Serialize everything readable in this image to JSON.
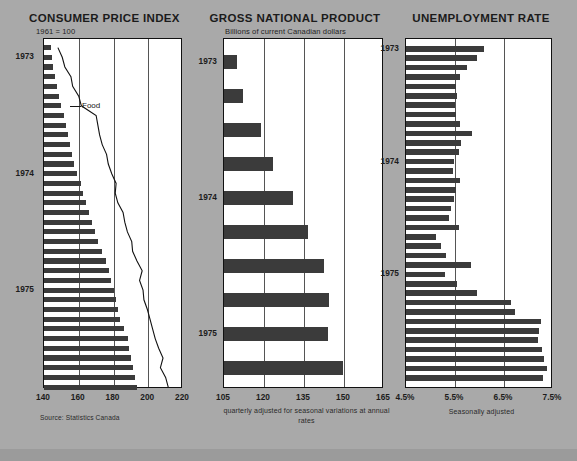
{
  "page": {
    "background_color": "#a9a9a9",
    "source_note": "Source: Statistics Canada"
  },
  "chart_data": [
    {
      "id": "consumer-price-index",
      "type": "bar",
      "orientation": "horizontal",
      "title": "CONSUMER PRICE INDEX",
      "subtitle": "1961 = 100",
      "xlabel": "",
      "ylabel": "",
      "xlim": [
        140,
        220
      ],
      "xticks": [
        "140",
        "160",
        "180",
        "200",
        "220"
      ],
      "xtick_values": [
        140,
        160,
        180,
        200,
        220
      ],
      "grid": true,
      "legend": "Food",
      "footnote": "Source: Statistics Canada",
      "ytick_labels": [
        "1973",
        "1974",
        "1975"
      ],
      "ytick_index": [
        1,
        13,
        25
      ],
      "categories": [
        "1973-01",
        "1973-02",
        "1973-03",
        "1973-04",
        "1973-05",
        "1973-06",
        "1973-07",
        "1973-08",
        "1973-09",
        "1973-10",
        "1973-11",
        "1973-12",
        "1974-01",
        "1974-02",
        "1974-03",
        "1974-04",
        "1974-05",
        "1974-06",
        "1974-07",
        "1974-08",
        "1974-09",
        "1974-10",
        "1974-11",
        "1974-12",
        "1975-01",
        "1975-02",
        "1975-03",
        "1975-04",
        "1975-05",
        "1975-06",
        "1975-07",
        "1975-08",
        "1975-09",
        "1975-10",
        "1975-11",
        "1975-12"
      ],
      "values": [
        143.8,
        144.6,
        145.4,
        146.3,
        147.2,
        148.4,
        149.6,
        151.6,
        152.8,
        153.9,
        154.8,
        155.9,
        157.2,
        159.2,
        161.1,
        162.3,
        164.0,
        165.8,
        167.5,
        169.6,
        171.2,
        173.6,
        175.6,
        177.2,
        178.5,
        180.1,
        181.4,
        182.4,
        184.0,
        185.9,
        188.2,
        189.2,
        190.2,
        191.5,
        192.5,
        193.8
      ],
      "series": [
        {
          "name": "Food",
          "type": "line",
          "values": [
            148.0,
            150.5,
            152.0,
            155.5,
            156.5,
            160.0,
            161.5,
            170.0,
            171.0,
            172.0,
            173.5,
            176.0,
            177.0,
            179.0,
            181.5,
            181.0,
            182.5,
            185.5,
            186.5,
            188.0,
            190.5,
            191.0,
            193.5,
            196.5,
            195.0,
            197.0,
            197.5,
            199.5,
            201.0,
            202.5,
            204.0,
            206.0,
            208.5,
            207.0,
            210.0,
            211.5
          ]
        }
      ]
    },
    {
      "id": "gross-national-product",
      "type": "bar",
      "orientation": "horizontal",
      "title": "GROSS NATIONAL PRODUCT",
      "subtitle": "Billions of current Canadian dollars",
      "xlabel": "",
      "ylabel": "",
      "xlim": [
        105,
        165
      ],
      "xticks": [
        "105",
        "120",
        "135",
        "150",
        "165"
      ],
      "xtick_values": [
        105,
        120,
        135,
        150,
        165
      ],
      "grid": true,
      "footnote": "quarterly adjusted for seasonal variations at annual rates",
      "ytick_labels": [
        "1973",
        "1974",
        "1975"
      ],
      "ytick_index": [
        0,
        4,
        8
      ],
      "categories": [
        "1973-Q1",
        "1973-Q2",
        "1973-Q3",
        "1973-Q4",
        "1974-Q1",
        "1974-Q2",
        "1974-Q3",
        "1974-Q4",
        "1975-Q1",
        "1975-Q2"
      ],
      "values": [
        110.0,
        112.0,
        119.0,
        123.5,
        131.0,
        136.5,
        142.5,
        144.5,
        144.0,
        149.5
      ]
    },
    {
      "id": "unemployment-rate",
      "type": "bar",
      "orientation": "horizontal",
      "title": "UNEMPLOYMENT RATE",
      "subtitle": "",
      "xlabel": "",
      "ylabel": "",
      "xlim": [
        4.5,
        7.5
      ],
      "xticks": [
        "4.5%",
        "5.5%",
        "6.5%",
        "7.5%"
      ],
      "xtick_values": [
        4.5,
        5.5,
        6.5,
        7.5
      ],
      "grid": true,
      "footnote": "Seasonally adjusted",
      "ytick_labels": [
        "1973",
        "1974",
        "1975"
      ],
      "ytick_index": [
        0,
        12,
        24
      ],
      "categories": [
        "1973-01",
        "1973-02",
        "1973-03",
        "1973-04",
        "1973-05",
        "1973-06",
        "1973-07",
        "1973-08",
        "1973-09",
        "1973-10",
        "1973-11",
        "1973-12",
        "1974-01",
        "1974-02",
        "1974-03",
        "1974-04",
        "1974-05",
        "1974-06",
        "1974-07",
        "1974-08",
        "1974-09",
        "1974-10",
        "1974-11",
        "1974-12",
        "1975-01",
        "1975-02",
        "1975-03",
        "1975-04",
        "1975-05",
        "1975-06",
        "1975-07",
        "1975-08",
        "1975-09",
        "1975-10",
        "1975-11",
        "1975-12"
      ],
      "values": [
        6.1,
        5.95,
        5.75,
        5.6,
        5.52,
        5.55,
        5.5,
        5.52,
        5.6,
        5.85,
        5.62,
        5.58,
        5.48,
        5.45,
        5.6,
        5.52,
        5.48,
        5.42,
        5.38,
        5.58,
        5.12,
        5.22,
        5.32,
        5.82,
        5.3,
        5.55,
        5.95,
        6.65,
        6.72,
        7.25,
        7.22,
        7.2,
        7.28,
        7.32,
        7.38,
        7.3
      ]
    }
  ]
}
